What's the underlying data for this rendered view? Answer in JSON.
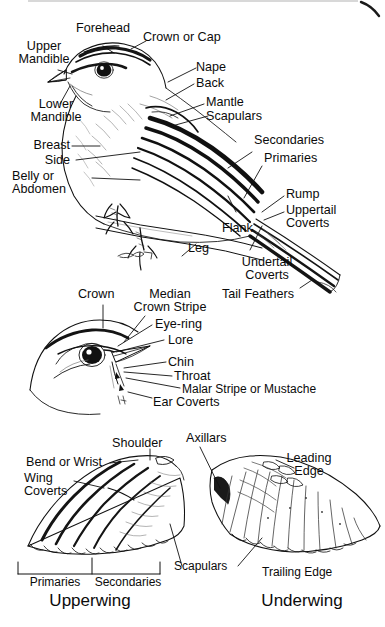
{
  "diagram": {
    "background_color": "#ffffff",
    "ink_color": "#0b0b0b",
    "panels": [
      {
        "name": "whole-bird",
        "caption": ""
      },
      {
        "name": "head-detail",
        "caption": ""
      },
      {
        "name": "upperwing",
        "caption": "Upperwing"
      },
      {
        "name": "underwing",
        "caption": "Underwing"
      }
    ]
  },
  "bird_labels": {
    "forehead": "Forehead",
    "crown_or_cap": "Crown or Cap",
    "upper_mandible": "Upper\nMandible",
    "lower_mandible": "Lower\nMandible",
    "nape": "Nape",
    "back": "Back",
    "mantle": "Mantle",
    "scapulars": "Scapulars",
    "breast": "Breast",
    "side": "Side",
    "belly_or_abdomen": "Belly or\nAbdomen",
    "secondaries": "Secondaries",
    "primaries": "Primaries",
    "rump": "Rump",
    "uppertail_coverts": "Uppertail\nCoverts",
    "flank": "Flank",
    "leg": "Leg",
    "undertail_coverts": "Undertail\nCoverts",
    "tail_feathers": "Tail Feathers"
  },
  "head_labels": {
    "crown": "Crown",
    "median_crown_stripe": "Median\nCrown Stripe",
    "eye_ring": "Eye-ring",
    "lore": "Lore",
    "chin": "Chin",
    "throat": "Throat",
    "malar_stripe": "Malar Stripe or Mustache",
    "ear_coverts": "Ear Coverts"
  },
  "upperwing_labels": {
    "shoulder": "Shoulder",
    "bend_or_wrist": "Bend or Wrist",
    "wing_coverts": "Wing\nCoverts",
    "primaries": "Primaries",
    "secondaries": "Secondaries",
    "caption": "Upperwing"
  },
  "underwing_labels": {
    "axillars": "Axillars",
    "leading_edge": "Leading\nEdge",
    "scapulars": "Scapulars",
    "trailing_edge": "Trailing Edge",
    "caption": "Underwing"
  }
}
